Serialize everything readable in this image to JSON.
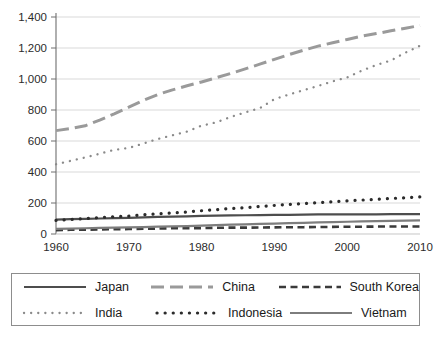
{
  "chart_data": {
    "type": "line",
    "title": "",
    "xlabel": "",
    "ylabel": "",
    "xlim": [
      1960,
      2010
    ],
    "ylim": [
      0,
      1400
    ],
    "ytick_labels": [
      "1,400",
      "1,200",
      "1,000",
      "800",
      "600",
      "400",
      "200",
      "0"
    ],
    "ytick_values": [
      1400,
      1200,
      1000,
      800,
      600,
      400,
      200,
      0
    ],
    "xtick_labels": [
      "1960",
      "1970",
      "1980",
      "1990",
      "2000",
      "2010"
    ],
    "xtick_values": [
      1960,
      1970,
      1980,
      1990,
      2000,
      2010
    ],
    "grid": "horizontal",
    "legend_position": "bottom",
    "x": [
      1960,
      1962,
      1964,
      1966,
      1968,
      1970,
      1972,
      1974,
      1976,
      1978,
      1980,
      1982,
      1984,
      1986,
      1988,
      1990,
      1992,
      1994,
      1996,
      1998,
      2000,
      2002,
      2004,
      2006,
      2008,
      2010
    ],
    "series": [
      {
        "name": "Japan",
        "style": "solid",
        "color": "#4d4d4d",
        "values": [
          93,
          96,
          98,
          100,
          102,
          104,
          107,
          110,
          112,
          114,
          117,
          119,
          120,
          121,
          122,
          124,
          124,
          125,
          126,
          126,
          127,
          127,
          127,
          128,
          128,
          128
        ]
      },
      {
        "name": "China",
        "style": "longdash",
        "color": "#9a9a9a",
        "values": [
          667,
          680,
          698,
          735,
          775,
          818,
          862,
          900,
          930,
          956,
          981,
          1008,
          1036,
          1065,
          1096,
          1127,
          1157,
          1186,
          1212,
          1234,
          1255,
          1276,
          1293,
          1311,
          1328,
          1345
        ]
      },
      {
        "name": "South Korea",
        "style": "dash",
        "color": "#3a3a3a",
        "values": [
          25,
          27,
          28,
          29,
          31,
          32,
          34,
          35,
          37,
          38,
          38,
          40,
          41,
          41,
          42,
          43,
          44,
          44,
          45,
          46,
          47,
          47,
          48,
          48,
          48,
          48
        ]
      },
      {
        "name": "India",
        "style": "dot-small",
        "color": "#8a8a8a",
        "values": [
          450,
          472,
          494,
          518,
          543,
          555,
          584,
          613,
          637,
          661,
          699,
          720,
          755,
          785,
          812,
          870,
          900,
          928,
          955,
          985,
          1010,
          1054,
          1090,
          1120,
          1170,
          1215
        ]
      },
      {
        "name": "Indonesia",
        "style": "dot-large",
        "color": "#2b2b2b",
        "values": [
          88,
          94,
          100,
          106,
          112,
          115,
          124,
          130,
          136,
          142,
          150,
          157,
          164,
          170,
          177,
          184,
          191,
          196,
          202,
          208,
          214,
          219,
          224,
          229,
          234,
          240
        ]
      },
      {
        "name": "Vietnam",
        "style": "solid",
        "color": "#7d7d7d",
        "values": [
          33,
          35,
          37,
          39,
          41,
          43,
          45,
          47,
          49,
          51,
          54,
          57,
          60,
          62,
          65,
          67,
          70,
          72,
          75,
          77,
          79,
          81,
          83,
          85,
          86,
          88
        ]
      }
    ]
  },
  "legend": {
    "rows": [
      [
        {
          "label": "Japan",
          "series": 0
        },
        {
          "label": "China",
          "series": 1
        },
        {
          "label": "South Korea",
          "series": 2
        }
      ],
      [
        {
          "label": "India",
          "series": 3
        },
        {
          "label": "Indonesia",
          "series": 4
        },
        {
          "label": "Vietnam",
          "series": 5
        }
      ]
    ]
  },
  "colors": {
    "axis": "#6e6e6e",
    "grid": "#d9d9d9",
    "legend_border": "#8d8d8d",
    "text": "#1a1a1a",
    "background": "#ffffff"
  }
}
